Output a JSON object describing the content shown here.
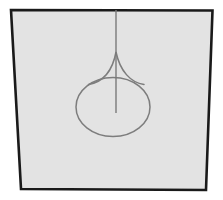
{
  "figure": {
    "canvas": {
      "width": 223,
      "height": 200,
      "outer_background": "#ffffff"
    },
    "frame": {
      "name": "quadrilateral-frame",
      "description": "Slightly trapezoidal four-sided border enclosing the figure",
      "fill_color": "#e3e3e3",
      "stroke_color": "#1a1a1a",
      "stroke_width": 2.6,
      "corners": {
        "top_left": [
          11,
          10
        ],
        "top_right": [
          212.5,
          10.5
        ],
        "bottom_right": [
          206,
          190
        ],
        "bottom_left": [
          21,
          189
        ]
      },
      "points_attr": "11,10 212.5,10.5 206,190 21,189"
    },
    "shape": {
      "name": "teardrop-balloon-curve",
      "stroke_color": "#7d7d7d",
      "stroke_width": 1.5,
      "fill": "none",
      "ellipse": {
        "center_x": 113,
        "center_y": 107,
        "radius_x": 37,
        "radius_y": 29.5
      },
      "cusp": {
        "apex_x": 116,
        "apex_y": 52,
        "left_base_x": 88,
        "left_base_y": 84,
        "right_base_x": 144,
        "right_base_y": 84,
        "path_attr": "M 88.5,84.5 C 103,82 112.5,71 116,52 C 120,71 130.5,82.5 144,84.5"
      }
    },
    "stem": {
      "name": "vertical-stem-line",
      "stroke_color": "#7a7a7a",
      "stroke_width": 1.4,
      "x": 116,
      "y_top": 10,
      "y_bottom": 113
    }
  }
}
